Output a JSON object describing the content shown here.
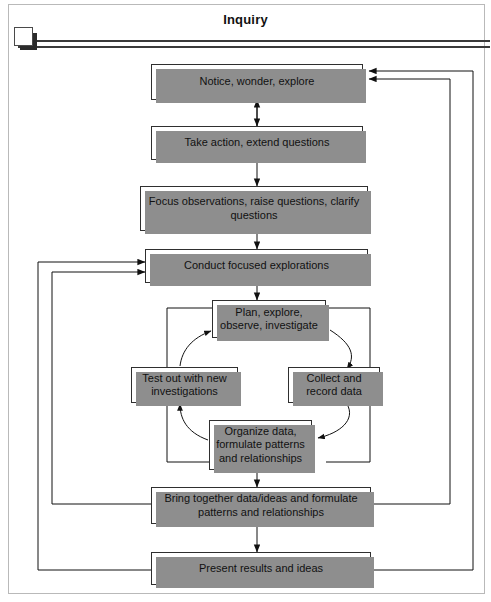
{
  "header": {
    "title": "Inquiry",
    "marker_icon": "square-marker-icon"
  },
  "diagram": {
    "type": "flowchart",
    "orientation": "vertical-with-central-cycle",
    "nodes": [
      {
        "id": "notice",
        "label": "Notice, wonder, explore"
      },
      {
        "id": "take",
        "label": "Take action, extend questions"
      },
      {
        "id": "focus",
        "label": "Focus observations, raise questions, clarify questions"
      },
      {
        "id": "conduct",
        "label": "Conduct focused explorations"
      },
      {
        "id": "plan",
        "label": "Plan, explore, observe, investigate"
      },
      {
        "id": "test",
        "label": "Test out with new investigations"
      },
      {
        "id": "collect",
        "label": "Collect and record data"
      },
      {
        "id": "organize",
        "label": "Organize data, formulate patterns and relationships"
      },
      {
        "id": "bring",
        "label": "Bring together data/ideas and formulate patterns and relationships"
      },
      {
        "id": "present",
        "label": "Present results and ideas"
      }
    ],
    "edges": [
      {
        "from": "notice",
        "to": "take",
        "style": "straight",
        "arrow": "both"
      },
      {
        "from": "take",
        "to": "focus",
        "style": "straight",
        "arrow": "single"
      },
      {
        "from": "focus",
        "to": "conduct",
        "style": "straight",
        "arrow": "single"
      },
      {
        "from": "conduct",
        "to": "plan",
        "style": "straight",
        "arrow": "single"
      },
      {
        "from": "plan",
        "to": "collect",
        "style": "curved",
        "arrow": "single"
      },
      {
        "from": "collect",
        "to": "organize",
        "style": "curved",
        "arrow": "single"
      },
      {
        "from": "organize",
        "to": "test",
        "style": "curved",
        "arrow": "single"
      },
      {
        "from": "test",
        "to": "plan",
        "style": "curved",
        "arrow": "single"
      },
      {
        "from": "organize",
        "to": "bring",
        "style": "straight",
        "arrow": "single"
      },
      {
        "from": "bring",
        "to": "present",
        "style": "straight",
        "arrow": "single"
      },
      {
        "from": "bring",
        "to": "notice",
        "style": "routed-right",
        "arrow": "single"
      },
      {
        "from": "present",
        "to": "notice",
        "style": "routed-right",
        "arrow": "single"
      },
      {
        "from": "bring",
        "to": "conduct",
        "style": "routed-left",
        "arrow": "single"
      },
      {
        "from": "present",
        "to": "conduct",
        "style": "routed-left",
        "arrow": "single"
      }
    ]
  },
  "style": {
    "box_border": "#2f2f2f",
    "box_fill": "#ffffff",
    "box_shadow": "#8e8e8e",
    "line_color": "#1a1a1a",
    "frame_color": "#b9b9b9"
  }
}
